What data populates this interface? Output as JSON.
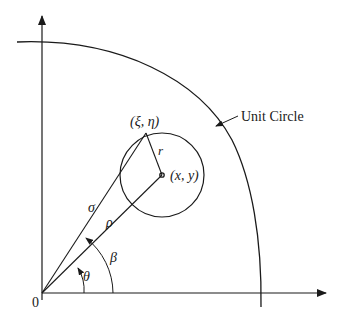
{
  "diagram": {
    "labels": {
      "origin": "0",
      "point_xi_eta": "(ξ, η)",
      "point_xy": "(x, y)",
      "radius": "r",
      "sigma": "σ",
      "rho": "ρ",
      "theta": "θ",
      "beta": "β",
      "unit_circle": "Unit Circle"
    },
    "colors": {
      "stroke": "#1a1a1a",
      "background": "#ffffff"
    }
  }
}
